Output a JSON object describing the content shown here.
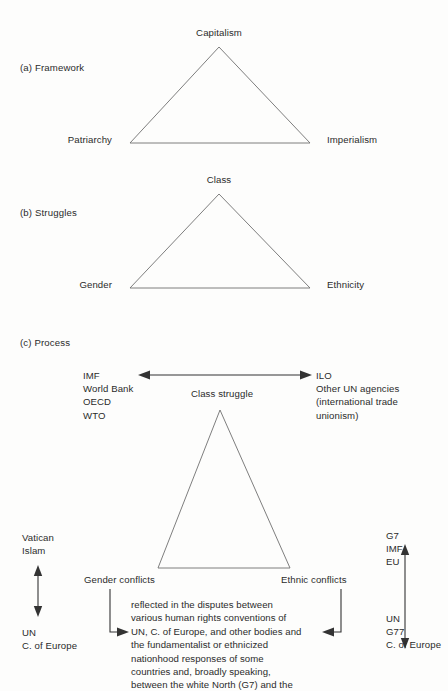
{
  "figure": {
    "background_color": "#fdfdfc",
    "line_color": "#6f6f6f",
    "arrow_color": "#333333",
    "text_color": "#2b2b2b"
  },
  "sections": {
    "a": {
      "label": "(a) Framework",
      "apex": "Capitalism",
      "left": "Patriarchy",
      "right": "Imperialism"
    },
    "b": {
      "label": "(b) Struggles",
      "apex": "Class",
      "left": "Gender",
      "right": "Ethnicity"
    },
    "c": {
      "label": "(c) Process",
      "top_left_block": "IMF\nWorld Bank\nOECD\nWTO",
      "top_right_block": "ILO\nOther UN agencies\n(international trade\nunionism)",
      "horizontal_arrow_label": "Class struggle",
      "left_upper_block": "Vatican\nIslam",
      "left_lower_block": "UN\nC. of Europe",
      "right_upper_block": "G7\nIMF\nEU",
      "right_lower_block": "UN\nG77\nC. of Europe",
      "base_left_label": "Gender conflicts",
      "base_right_label": "Ethnic conflicts",
      "center_paragraph": "reflected in the disputes between\nvarious human rights conventions of\nUN, C. of Europe, and other bodies and\nthe fundamentalist or ethnicized\nnationhood responses of some\ncountries and, broadly speaking,\nbetween the white North (G7) and the"
    }
  },
  "icons": {
    "double_arrow_horizontal": "double-headed-horizontal-arrow",
    "double_arrow_vertical": "double-headed-vertical-arrow",
    "elbow_arrow_left": "elbow-arrow-pointing-right",
    "elbow_arrow_right": "elbow-arrow-pointing-left"
  }
}
